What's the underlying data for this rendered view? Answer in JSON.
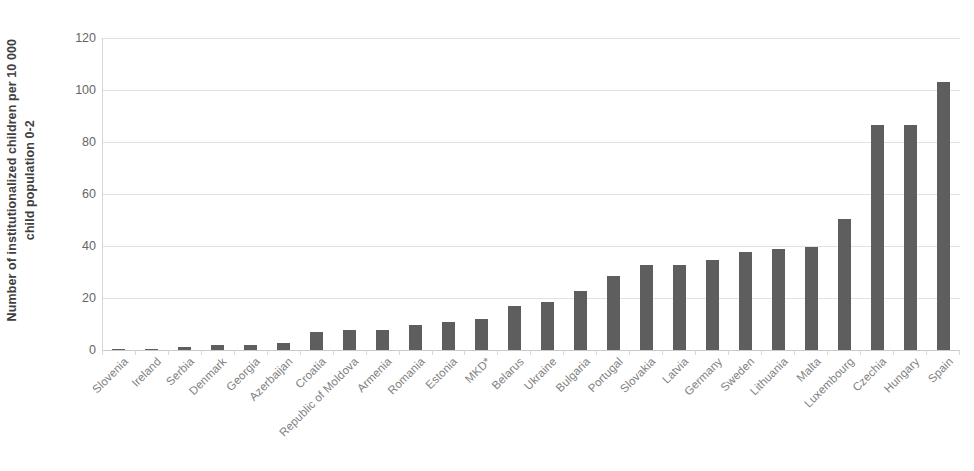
{
  "chart_data": {
    "type": "bar",
    "title": "",
    "xlabel": "",
    "ylabel": "Number of institutionalized children per 10 000 child population 0-2",
    "ylim": [
      0,
      120
    ],
    "yticks": [
      120,
      100,
      80,
      60,
      40,
      20,
      0
    ],
    "grid": true,
    "legend": false,
    "bar_color": "#5e5e5e",
    "categories": [
      "Slovenia",
      "Ireland",
      "Serbia",
      "Denmark",
      "Georgia",
      "Azerbaijan",
      "Croatia",
      "Republic of Moldova",
      "Armenia",
      "Romania",
      "Estonia",
      "MKD*",
      "Belarus",
      "Ukraine",
      "Bulgaria",
      "Portugal",
      "Slovakia",
      "Latvia",
      "Germany",
      "Sweden",
      "Lithuania",
      "Malta",
      "Luxembourg",
      "Czechia",
      "Hungary",
      "Spain"
    ],
    "values": [
      0.2,
      0.3,
      1.1,
      2.0,
      1.8,
      2.7,
      7.0,
      7.7,
      7.7,
      9.7,
      10.8,
      12.0,
      16.8,
      18.5,
      22.8,
      28.5,
      32.8,
      32.8,
      34.5,
      37.8,
      38.8,
      39.6,
      50.5,
      86.4,
      86.4,
      103.0
    ]
  },
  "footnote": "",
  "axis": {
    "y_title_line1": "Number of institutionalized children per 10 000",
    "y_title_line2": "child population 0-2"
  }
}
